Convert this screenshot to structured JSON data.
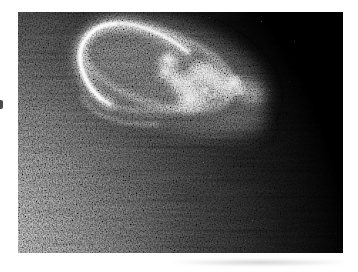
{
  "page": {
    "background": "#ffffff"
  },
  "photo": {
    "colors": {
      "space": "#000000",
      "dayglow_bright": "#8a8a8a",
      "dayglow_mid": "#6c6c6c",
      "dayglow_dim": "#474747",
      "dayglow_faint": "#242424",
      "dayglow_edge": "#0c0c0c",
      "aurora_outer_glow": "#565656",
      "aurora_interior_haze": "#4f4f4f",
      "aurora_underglow": "#3e3e3e",
      "aurora_ring": "#b5b5b5",
      "aurora_ring_lower": "#a0a0a0",
      "aurora_rim_glow": "#e8e8e8",
      "aurora_rim_bright": "#f2f2f2",
      "aurora_rim_core": "#ffffff",
      "aurora_cloud": "#d6d6d6",
      "aurora_knots": "#efefef",
      "aurora_swirl": "#cccccc",
      "aurora_right_fade": "#9a9a9a",
      "secondary_arc": "#8e8e8e"
    }
  }
}
